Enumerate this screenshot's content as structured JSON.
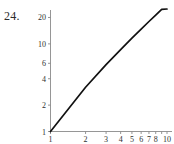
{
  "problem": {
    "number_label": "24."
  },
  "colors": {
    "background": "#ffffff",
    "curve": "#111111",
    "axis": "#8a8a8a",
    "text": "#2f2f2f"
  },
  "chart_data": {
    "type": "line",
    "title": "",
    "xlabel": "",
    "ylabel": "",
    "xscale": "log",
    "yscale": "log",
    "xlim": [
      1,
      10
    ],
    "ylim": [
      1,
      25
    ],
    "grid": false,
    "legend": null,
    "x_ticks": [
      1,
      2,
      3,
      4,
      5,
      6,
      7,
      8,
      10
    ],
    "x_tick_labels": [
      "1",
      "2",
      "3",
      "4",
      "5",
      "6",
      "7",
      "8",
      "10"
    ],
    "y_ticks": [
      1,
      2,
      4,
      6,
      10,
      20
    ],
    "y_tick_labels": [
      "1",
      "2",
      "4",
      "6",
      "10",
      "20"
    ],
    "series": [
      {
        "name": "line",
        "x": [
          1,
          2,
          3,
          4,
          5,
          6,
          7,
          8,
          9,
          10
        ],
        "y": [
          1,
          3.2,
          5.8,
          8.6,
          11.6,
          14.7,
          18.0,
          21.3,
          24.8,
          25.0
        ]
      }
    ],
    "annotations": []
  }
}
